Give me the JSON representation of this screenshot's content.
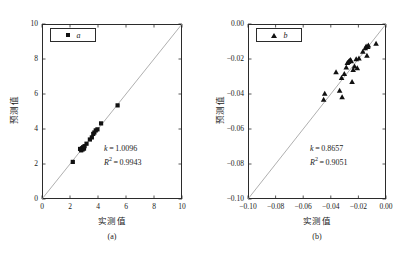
{
  "figure": {
    "panel_a_caption": "(a)",
    "panel_b_caption": "(b)",
    "axis_x_label": "实测值",
    "axis_y_label": "预测值"
  },
  "chart_data": [
    {
      "type": "scatter",
      "panel": "(a)",
      "title": "",
      "xlabel": "实测值",
      "ylabel": "预测值",
      "xlim": [
        0,
        10
      ],
      "ylim": [
        0,
        10
      ],
      "xticks": [
        0,
        2,
        4,
        6,
        8,
        10
      ],
      "yticks": [
        0,
        2,
        4,
        6,
        8,
        10
      ],
      "xtick_labels": [
        "0",
        "2",
        "4",
        "6",
        "8",
        "10"
      ],
      "ytick_labels": [
        "0",
        "2",
        "4",
        "6",
        "8",
        "10"
      ],
      "grid": false,
      "legend": [
        {
          "label": "a",
          "marker": "square"
        }
      ],
      "legend_position": "upper-left",
      "reference_line": {
        "type": "identity",
        "from": [
          0,
          0
        ],
        "to": [
          10,
          10
        ]
      },
      "annotations": [
        {
          "text": "k = 1.0096",
          "symbol": "k",
          "value": 1.0096
        },
        {
          "text": "R² = 0.9943",
          "symbol": "R2",
          "value": 0.9943
        }
      ],
      "points": [
        {
          "x": 2.2,
          "y": 2.12
        },
        {
          "x": 2.72,
          "y": 2.86
        },
        {
          "x": 2.8,
          "y": 2.78
        },
        {
          "x": 2.86,
          "y": 2.9
        },
        {
          "x": 2.9,
          "y": 2.83
        },
        {
          "x": 2.94,
          "y": 2.96
        },
        {
          "x": 3.0,
          "y": 2.88
        },
        {
          "x": 3.04,
          "y": 3.02
        },
        {
          "x": 3.18,
          "y": 3.16
        },
        {
          "x": 3.42,
          "y": 3.4
        },
        {
          "x": 3.56,
          "y": 3.52
        },
        {
          "x": 3.66,
          "y": 3.72
        },
        {
          "x": 3.74,
          "y": 3.8
        },
        {
          "x": 3.84,
          "y": 3.92
        },
        {
          "x": 3.96,
          "y": 3.98
        },
        {
          "x": 4.22,
          "y": 4.32
        },
        {
          "x": 5.4,
          "y": 5.35
        }
      ]
    },
    {
      "type": "scatter",
      "panel": "(b)",
      "title": "",
      "xlabel": "实测值",
      "ylabel": "预测值",
      "xlim": [
        -0.1,
        0.0
      ],
      "ylim": [
        -0.1,
        0.0
      ],
      "xticks": [
        -0.1,
        -0.08,
        -0.06,
        -0.04,
        -0.02,
        0.0
      ],
      "yticks": [
        -0.1,
        -0.08,
        -0.06,
        -0.04,
        -0.02,
        0.0
      ],
      "xtick_labels": [
        "-0.10",
        "-0.08",
        "-0.06",
        "-0.04",
        "-0.02",
        "0.00"
      ],
      "ytick_labels": [
        "-0.10",
        "-0.08",
        "-0.06",
        "-0.04",
        "-0.02",
        "0.00"
      ],
      "grid": false,
      "legend": [
        {
          "label": "b",
          "marker": "triangle"
        }
      ],
      "legend_position": "upper-left",
      "reference_line": {
        "type": "identity",
        "from": [
          -0.1,
          -0.1
        ],
        "to": [
          0.0,
          0.0
        ]
      },
      "annotations": [
        {
          "text": "k = 0.8657",
          "symbol": "k",
          "value": 0.8657
        },
        {
          "text": "R² = 0.9051",
          "symbol": "R2",
          "value": 0.9051
        }
      ],
      "points": [
        {
          "x": -0.0452,
          "y": -0.0432
        },
        {
          "x": -0.0444,
          "y": -0.0398
        },
        {
          "x": -0.0362,
          "y": -0.0275
        },
        {
          "x": -0.0336,
          "y": -0.038
        },
        {
          "x": -0.0322,
          "y": -0.0308
        },
        {
          "x": -0.0318,
          "y": -0.0418
        },
        {
          "x": -0.0302,
          "y": -0.0285
        },
        {
          "x": -0.0288,
          "y": -0.0248
        },
        {
          "x": -0.028,
          "y": -0.0222
        },
        {
          "x": -0.0272,
          "y": -0.0216
        },
        {
          "x": -0.0266,
          "y": -0.021
        },
        {
          "x": -0.0258,
          "y": -0.0205
        },
        {
          "x": -0.0252,
          "y": -0.0212
        },
        {
          "x": -0.0246,
          "y": -0.033
        },
        {
          "x": -0.0238,
          "y": -0.0262
        },
        {
          "x": -0.0228,
          "y": -0.0242
        },
        {
          "x": -0.0216,
          "y": -0.02
        },
        {
          "x": -0.0208,
          "y": -0.0252
        },
        {
          "x": -0.0196,
          "y": -0.0196
        },
        {
          "x": -0.0168,
          "y": -0.0158
        },
        {
          "x": -0.015,
          "y": -0.0138
        },
        {
          "x": -0.0144,
          "y": -0.0128
        },
        {
          "x": -0.0138,
          "y": -0.018
        },
        {
          "x": -0.0132,
          "y": -0.013
        },
        {
          "x": -0.0128,
          "y": -0.0122
        },
        {
          "x": -0.0072,
          "y": -0.0112
        }
      ]
    }
  ]
}
